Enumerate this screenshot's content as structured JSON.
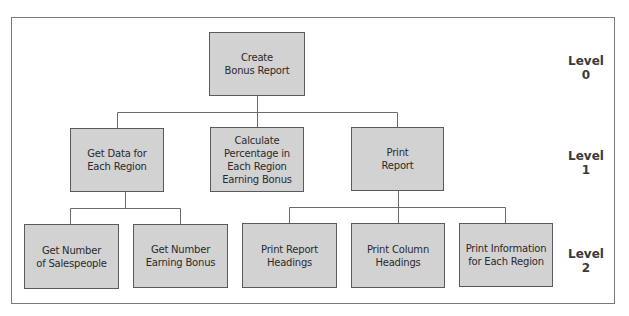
{
  "diagram": {
    "type": "hierarchy-chart",
    "nodes": {
      "root": "Create\nBonus Report",
      "get_data": "Get Data for\nEach Region",
      "calculate": "Calculate\nPercentage in\nEach Region\nEarning Bonus",
      "print_report": "Print\nReport",
      "get_salespeople": "Get Number\nof Salespeople",
      "get_earning": "Get Number\nEarning Bonus",
      "print_report_headings": "Print Report\nHeadings",
      "print_column_headings": "Print Column\nHeadings",
      "print_information": "Print Information\nfor Each Region"
    },
    "edges": [
      [
        "root",
        "get_data"
      ],
      [
        "root",
        "calculate"
      ],
      [
        "root",
        "print_report"
      ],
      [
        "get_data",
        "get_salespeople"
      ],
      [
        "get_data",
        "get_earning"
      ],
      [
        "print_report",
        "print_report_headings"
      ],
      [
        "print_report",
        "print_column_headings"
      ],
      [
        "print_report",
        "print_information"
      ]
    ],
    "levels": [
      "Level 0",
      "Level 1",
      "Level 2"
    ]
  }
}
